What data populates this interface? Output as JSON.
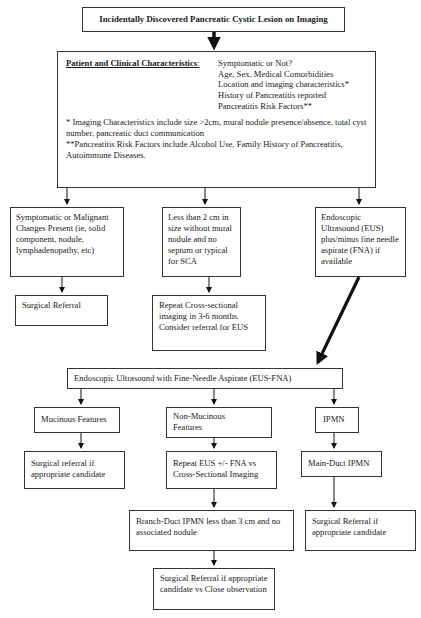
{
  "diagram": {
    "type": "flowchart",
    "title_box": "Incidentally Discovered Pancreatic Cystic Lesion on Imaging",
    "characteristics_box": {
      "heading": "Patient and Clinical Characteristics",
      "colon": ":",
      "items": [
        "Symptomatic or Not?",
        "Age, Sex, Medical Comorbidities",
        "Location and imaging characteristics*",
        "History of Pancreatitis reported",
        "Pancreatitis Risk Factors**"
      ],
      "notes": [
        "* Imaging Characteristics include size >2cm, mural nodule presence/absence, total cyst number, pancreatic duct communication",
        "**Pancreatitis Risk Factors include Alcohol Use, Family History of Pancreatitis, Autoimmune Diseases."
      ]
    },
    "branch_1": {
      "condition": "Symptomatic or Malignant Changes Present (ie, solid component, nodule, lymphadenopathy, etc)",
      "action": "Surgical Referral"
    },
    "branch_2": {
      "condition": "Less than 2 cm in size without mural nodule and no septum or typical for SCA",
      "action": "Repeat Cross-sectional imaging in 3-6 months. Consider referral for EUS"
    },
    "branch_3": {
      "condition": "Endoscopic Ultrasound (EUS) plus/minus fine needle aspirate (FNA) if available"
    },
    "eus_fna_box": "Endoscopic Ultrasound with Fine-Needle Aspirate (EUS-FNA)",
    "eus_results": {
      "mucinous": {
        "label": "Mucinous Features",
        "action": "Surgical referral if appropriate candidate"
      },
      "non_mucinous": {
        "label": "Non-Mucinous Features",
        "action": "Repeat EUS +/- FNA vs Cross-Sectional Imaging",
        "next": "Branch-Duct IPMN less than 3 cm and no associated nodule",
        "final": "Surgical Referral if appropriate candidate vs Close observation"
      },
      "ipmn": {
        "label": "IPMN",
        "subtype": "Main-Duct IPMN",
        "action": "Surgical Referral if appropriate candidate"
      }
    },
    "colors": {
      "line": "#111111",
      "border": "#333333",
      "background": "#ffffff"
    }
  }
}
